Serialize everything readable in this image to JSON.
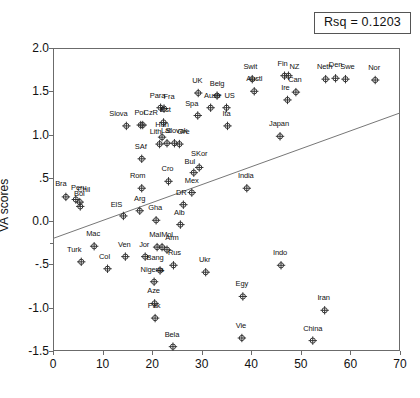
{
  "annotation": {
    "rsq_label": "Rsq = 0.1203"
  },
  "chart_data": {
    "type": "scatter",
    "title": "",
    "xlabel": "",
    "ylabel": "VA scores",
    "xlim": [
      0,
      70
    ],
    "ylim": [
      -1.5,
      2.0
    ],
    "xticks": [
      "0",
      "10",
      "20",
      "30",
      "40",
      "50",
      "60",
      "70"
    ],
    "xtick_values": [
      0,
      10,
      20,
      30,
      40,
      50,
      60,
      70
    ],
    "yticks": [
      "2.0",
      "1.5",
      "1.0",
      ".5",
      "0.0",
      "-.5",
      "-1.0",
      "-1.5"
    ],
    "ytick_values": [
      2.0,
      1.5,
      1.0,
      0.5,
      0.0,
      -0.5,
      -1.0,
      -1.5
    ],
    "grid": false,
    "legend": null,
    "marker": "crosshair-circle",
    "fit_line": {
      "type": "linear",
      "x0": 0,
      "y0": -0.2,
      "x1": 70,
      "y1": 1.25,
      "rsq": 0.1203
    },
    "points": [
      {
        "label": "Bra",
        "x": 2.6,
        "y": 0.28,
        "lx": -5,
        "ly": -5
      },
      {
        "label": "Peru",
        "x": 4.6,
        "y": 0.25,
        "lx": 3,
        "ly": -4
      },
      {
        "label": "Chil",
        "x": 5.4,
        "y": 0.22,
        "lx": 4,
        "ly": -4
      },
      {
        "label": "Bol",
        "x": 5.5,
        "y": 0.17,
        "lx": -1,
        "ly": -4
      },
      {
        "label": "Turk",
        "x": 5.7,
        "y": -0.47,
        "lx": -7,
        "ly": -4
      },
      {
        "label": "Mac",
        "x": 8.3,
        "y": -0.29,
        "lx": -1,
        "ly": -4
      },
      {
        "label": "Col",
        "x": 11.0,
        "y": -0.55,
        "lx": -3,
        "ly": -4
      },
      {
        "label": "ElS",
        "x": 14.2,
        "y": 0.06,
        "lx": -7,
        "ly": -3
      },
      {
        "label": "Ven",
        "x": 14.6,
        "y": -0.41,
        "lx": -1,
        "ly": -4
      },
      {
        "label": "Slova",
        "x": 14.8,
        "y": 1.1,
        "lx": -8,
        "ly": -4
      },
      {
        "label": "Arg",
        "x": 17.5,
        "y": 0.12,
        "lx": 0,
        "ly": -4
      },
      {
        "label": "Pol",
        "x": 17.7,
        "y": 1.11,
        "lx": -1,
        "ly": -4
      },
      {
        "label": "CzR",
        "x": 18.1,
        "y": 1.11,
        "lx": 8,
        "ly": -4
      },
      {
        "label": "SAf",
        "x": 17.9,
        "y": 0.72,
        "lx": -1,
        "ly": -4
      },
      {
        "label": "Rom",
        "x": 17.9,
        "y": 0.38,
        "lx": -4,
        "ly": -4
      },
      {
        "label": "Jor",
        "x": 18.6,
        "y": -0.41,
        "lx": -1,
        "ly": -4
      },
      {
        "label": "Nigeria",
        "x": 20.4,
        "y": -0.7,
        "lx": -2,
        "ly": -4
      },
      {
        "label": "Aze",
        "x": 20.5,
        "y": -0.95,
        "lx": -1,
        "ly": -4
      },
      {
        "label": "Pak",
        "x": 20.6,
        "y": -1.12,
        "lx": -1,
        "ly": -4
      },
      {
        "label": "Gha",
        "x": 20.8,
        "y": 0.01,
        "lx": -1,
        "ly": -4
      },
      {
        "label": "Mal",
        "x": 21.0,
        "y": -0.3,
        "lx": -2,
        "ly": -4
      },
      {
        "label": "Mol",
        "x": 22.0,
        "y": -0.3,
        "lx": 5,
        "ly": -4
      },
      {
        "label": "Bang",
        "x": 21.6,
        "y": -0.57,
        "lx": -5,
        "ly": -4
      },
      {
        "label": "Lith",
        "x": 21.5,
        "y": 0.89,
        "lx": -4,
        "ly": -4
      },
      {
        "label": "Hun",
        "x": 22.0,
        "y": 0.97,
        "lx": 0,
        "ly": -4
      },
      {
        "label": "Est",
        "x": 22.3,
        "y": 1.14,
        "lx": 2,
        "ly": -4
      },
      {
        "label": "Para",
        "x": 21.7,
        "y": 1.31,
        "lx": -3,
        "ly": -4
      },
      {
        "label": "Fra",
        "x": 22.4,
        "y": 1.3,
        "lx": 5,
        "ly": -4
      },
      {
        "label": "Lat",
        "x": 23.0,
        "y": 0.9,
        "lx": -1,
        "ly": -4
      },
      {
        "label": "Arm",
        "x": 23.0,
        "y": -0.33,
        "lx": 5,
        "ly": -4
      },
      {
        "label": "Cro",
        "x": 23.3,
        "y": 0.46,
        "lx": -1,
        "ly": -4
      },
      {
        "label": "Bela",
        "x": 24.2,
        "y": -1.45,
        "lx": -1,
        "ly": -4
      },
      {
        "label": "Rus",
        "x": 24.3,
        "y": -0.51,
        "lx": 1,
        "ly": -4
      },
      {
        "label": "Slovak",
        "x": 24.5,
        "y": 0.9,
        "lx": 2,
        "ly": -4
      },
      {
        "label": "Gre",
        "x": 25.5,
        "y": 0.89,
        "lx": 4,
        "ly": -4
      },
      {
        "label": "Alb",
        "x": 25.7,
        "y": -0.04,
        "lx": -1,
        "ly": -4
      },
      {
        "label": "DR",
        "x": 26.3,
        "y": 0.19,
        "lx": -2,
        "ly": -4
      },
      {
        "label": "Bul",
        "x": 28.4,
        "y": 0.56,
        "lx": -4,
        "ly": -3
      },
      {
        "label": "Mex",
        "x": 28.0,
        "y": 0.33,
        "lx": 0,
        "ly": -4
      },
      {
        "label": "SKor",
        "x": 29.5,
        "y": 0.62,
        "lx": 0,
        "ly": -5
      },
      {
        "label": "Spa",
        "x": 29.2,
        "y": 1.22,
        "lx": -6,
        "ly": -4
      },
      {
        "label": "UK",
        "x": 29.3,
        "y": 1.48,
        "lx": -1,
        "ly": -4
      },
      {
        "label": "Ukr",
        "x": 30.8,
        "y": -0.59,
        "lx": -1,
        "ly": -4
      },
      {
        "label": "Austr",
        "x": 31.8,
        "y": 1.31,
        "lx": 2,
        "ly": -4
      },
      {
        "label": "Belg",
        "x": 33.1,
        "y": 1.45,
        "lx": 0,
        "ly": -4
      },
      {
        "label": "US",
        "x": 35.0,
        "y": 1.31,
        "lx": 3,
        "ly": -4
      },
      {
        "label": "Ita",
        "x": 35.2,
        "y": 1.1,
        "lx": -1,
        "ly": -4
      },
      {
        "label": "India",
        "x": 39.1,
        "y": 0.38,
        "lx": -1,
        "ly": -4
      },
      {
        "label": "Egy",
        "x": 38.3,
        "y": -0.87,
        "lx": -1,
        "ly": -4
      },
      {
        "label": "Vie",
        "x": 38.1,
        "y": -1.35,
        "lx": -1,
        "ly": -4
      },
      {
        "label": "Swit",
        "x": 40.2,
        "y": 1.64,
        "lx": -2,
        "ly": -4
      },
      {
        "label": "Austl",
        "x": 40.6,
        "y": 1.5,
        "lx": 0,
        "ly": -4
      },
      {
        "label": "Japan",
        "x": 45.8,
        "y": 0.98,
        "lx": -1,
        "ly": -4
      },
      {
        "label": "Fin",
        "x": 46.7,
        "y": 1.68,
        "lx": -2,
        "ly": -4
      },
      {
        "label": "Indo",
        "x": 46.0,
        "y": -0.51,
        "lx": -1,
        "ly": -4
      },
      {
        "label": "NZ",
        "x": 47.5,
        "y": 1.68,
        "lx": 6,
        "ly": -1
      },
      {
        "label": "Ire",
        "x": 47.3,
        "y": 1.4,
        "lx": -2,
        "ly": -4
      },
      {
        "label": "Can",
        "x": 49.0,
        "y": 1.49,
        "lx": -1,
        "ly": -4
      },
      {
        "label": "China",
        "x": 52.4,
        "y": -1.38,
        "lx": 0,
        "ly": -4
      },
      {
        "label": "Iran",
        "x": 54.8,
        "y": -1.03,
        "lx": -1,
        "ly": -4
      },
      {
        "label": "Neth",
        "x": 55.0,
        "y": 1.64,
        "lx": -1,
        "ly": -4
      },
      {
        "label": "Den",
        "x": 57.0,
        "y": 1.65,
        "lx": 0,
        "ly": -5
      },
      {
        "label": "Swe",
        "x": 59.0,
        "y": 1.64,
        "lx": 2,
        "ly": -4
      },
      {
        "label": "Nor",
        "x": 65.0,
        "y": 1.63,
        "lx": -1,
        "ly": -4
      }
    ]
  },
  "colors": {
    "axis": "#6b6b6b",
    "text": "#111111",
    "marker": "#333333",
    "fit_line": "#777777",
    "box_border": "#555555"
  }
}
